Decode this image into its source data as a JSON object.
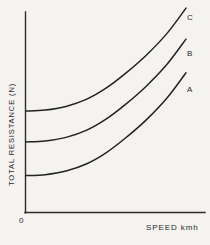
{
  "figure": {
    "background_color": "#f4f3f0",
    "line_color": "#232323",
    "axis_color": "#2b2b2b"
  },
  "axes": {
    "origin_label": "0",
    "ylabel": "TOTAL RESISTANCE (N)",
    "xlabel": "SPEED  kmh"
  },
  "labels": {
    "curve_a": "A",
    "curve_b": "B",
    "curve_c": "C"
  },
  "chart_data": {
    "type": "line",
    "title": "",
    "xlabel": "SPEED  kmh",
    "ylabel": "TOTAL RESISTANCE (N)",
    "grid": false,
    "legend": "inline-right-end-labels",
    "xlim": [
      0,
      1
    ],
    "ylim": [
      0,
      1
    ],
    "axis_ticks": false,
    "origin_label": "0",
    "series": [
      {
        "name": "A",
        "label": "A",
        "x": [
          0.0,
          0.12,
          0.25,
          0.38,
          0.5,
          0.62,
          0.75,
          0.88,
          1.0
        ],
        "y": [
          0.2,
          0.205,
          0.225,
          0.265,
          0.325,
          0.405,
          0.505,
          0.625,
          0.765
        ]
      },
      {
        "name": "B",
        "label": "B",
        "x": [
          0.0,
          0.12,
          0.25,
          0.38,
          0.5,
          0.62,
          0.75,
          0.88,
          1.0
        ],
        "y": [
          0.385,
          0.39,
          0.41,
          0.45,
          0.51,
          0.59,
          0.69,
          0.81,
          0.95
        ]
      },
      {
        "name": "C",
        "label": "C",
        "x": [
          0.0,
          0.12,
          0.25,
          0.38,
          0.5,
          0.62,
          0.75,
          0.88,
          1.0
        ],
        "y": [
          0.555,
          0.56,
          0.58,
          0.62,
          0.68,
          0.76,
          0.86,
          0.98,
          1.12
        ]
      }
    ]
  }
}
